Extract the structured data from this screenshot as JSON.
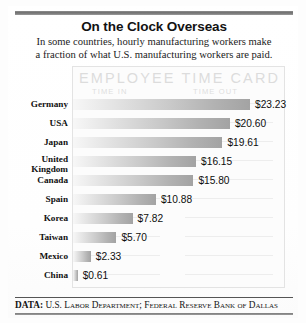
{
  "header": {
    "title": "On the Clock Overseas",
    "subtitle_line1": "In some countries, hourly manufacturing workers make",
    "subtitle_line2": "a fraction of what U.S. manufacturing workers are paid."
  },
  "card": {
    "watermark_title": "EMPLOYEE TIME CARD",
    "column_in": "TIME IN",
    "column_out": "TIME OUT"
  },
  "footer": {
    "label": "DATA:",
    "source": "U.S. Labor Department; Federal Reserve Bank of Dallas"
  },
  "chart_data": {
    "type": "bar",
    "orientation": "horizontal",
    "title": "On the Clock Overseas",
    "subtitle": "In some countries, hourly manufacturing workers make a fraction of what U.S. manufacturing workers are paid.",
    "xlabel": "",
    "ylabel": "",
    "unit": "USD per hour",
    "xlim": [
      0,
      23.23
    ],
    "grid": false,
    "legend": false,
    "categories": [
      "Germany",
      "USA",
      "Japan",
      "United Kingdom",
      "Canada",
      "Spain",
      "Korea",
      "Taiwan",
      "Mexico",
      "China"
    ],
    "values": [
      23.23,
      20.6,
      19.61,
      16.15,
      15.8,
      10.88,
      7.82,
      5.7,
      2.33,
      0.61
    ],
    "value_labels": [
      "$23.23",
      "$20.60",
      "$19.61",
      "$16.15",
      "$15.80",
      "$10.88",
      "$7.82",
      "$5.70",
      "$2.33",
      "$0.61"
    ],
    "category_labels": [
      "Germany",
      "USA",
      "Japan",
      "United\nKingdom",
      "Canada",
      "Spain",
      "Korea",
      "Taiwan",
      "Mexico",
      "China"
    ],
    "source": "U.S. Labor Department; Federal Reserve Bank of Dallas"
  },
  "colors": {
    "bar_light": "#f7f7f7",
    "bar_dark": "#a3a3a3",
    "rule": "#6f6f6f",
    "text": "#111111",
    "watermark": "#dcdcdc"
  }
}
